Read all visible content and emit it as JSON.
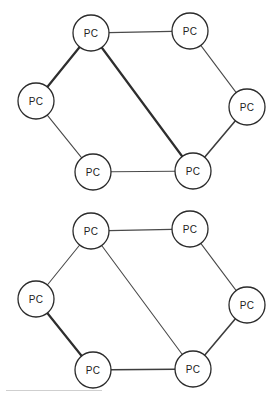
{
  "figure": {
    "background_color": "#ffffff",
    "node_fill": "#ffffff",
    "node_stroke": "#2b2b2b",
    "edge_color": "#3a3a3a",
    "label_color": "#222222"
  },
  "chart_data": {
    "type": "diagram",
    "diagram_type": "network-topology-graph",
    "title": "",
    "count": 2,
    "graphs": [
      {
        "id": "diagram-1",
        "name": "upper-network-diagram",
        "nodes": [
          {
            "id": "n1",
            "label": "PC",
            "x": 91,
            "y": 33,
            "r": 18,
            "position": "top-left"
          },
          {
            "id": "n2",
            "label": "PC",
            "x": 190,
            "y": 31,
            "r": 18,
            "position": "top-right"
          },
          {
            "id": "n3",
            "label": "PC",
            "x": 247,
            "y": 107,
            "r": 18,
            "position": "right"
          },
          {
            "id": "n4",
            "label": "PC",
            "x": 193,
            "y": 171,
            "r": 18,
            "position": "bottom-right"
          },
          {
            "id": "n5",
            "label": "PC",
            "x": 93,
            "y": 172,
            "r": 18,
            "position": "bottom-left"
          },
          {
            "id": "n6",
            "label": "PC",
            "x": 36,
            "y": 101,
            "r": 18,
            "position": "left"
          }
        ],
        "edges": [
          {
            "from": "n1",
            "to": "n2",
            "weight": "thin"
          },
          {
            "from": "n2",
            "to": "n3",
            "weight": "thin"
          },
          {
            "from": "n3",
            "to": "n4",
            "weight": "med"
          },
          {
            "from": "n4",
            "to": "n5",
            "weight": "thin"
          },
          {
            "from": "n5",
            "to": "n6",
            "weight": "thin"
          },
          {
            "from": "n6",
            "to": "n1",
            "weight": "bold"
          },
          {
            "from": "n1",
            "to": "n4",
            "weight": "bold"
          }
        ]
      },
      {
        "id": "diagram-2",
        "name": "lower-network-diagram",
        "nodes": [
          {
            "id": "m1",
            "label": "PC",
            "x": 91,
            "y": 33,
            "r": 18,
            "position": "top-left"
          },
          {
            "id": "m2",
            "label": "PC",
            "x": 190,
            "y": 31,
            "r": 18,
            "position": "top-right"
          },
          {
            "id": "m3",
            "label": "PC",
            "x": 247,
            "y": 107,
            "r": 18,
            "position": "right"
          },
          {
            "id": "m4",
            "label": "PC",
            "x": 193,
            "y": 171,
            "r": 18,
            "position": "bottom-right"
          },
          {
            "id": "m5",
            "label": "PC",
            "x": 93,
            "y": 172,
            "r": 18,
            "position": "bottom-left"
          },
          {
            "id": "m6",
            "label": "PC",
            "x": 36,
            "y": 101,
            "r": 18,
            "position": "left"
          }
        ],
        "edges": [
          {
            "from": "m1",
            "to": "m2",
            "weight": "thin"
          },
          {
            "from": "m2",
            "to": "m3",
            "weight": "thin"
          },
          {
            "from": "m3",
            "to": "m4",
            "weight": "med"
          },
          {
            "from": "m4",
            "to": "m5",
            "weight": "med"
          },
          {
            "from": "m5",
            "to": "m6",
            "weight": "bold"
          },
          {
            "from": "m6",
            "to": "m1",
            "weight": "thin"
          },
          {
            "from": "m1",
            "to": "m4",
            "weight": "thin"
          }
        ]
      }
    ]
  }
}
